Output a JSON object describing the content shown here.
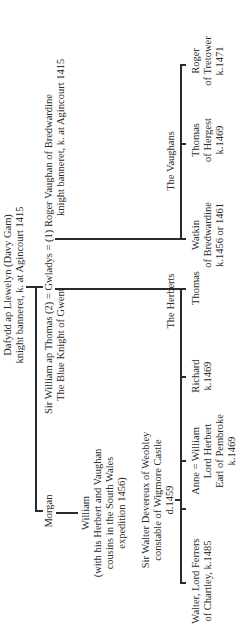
{
  "diagram": {
    "type": "family-tree",
    "orientation": "rotated-90-ccw",
    "root": {
      "line1": "Dafydd ap Llewelyn (Davy Gam)",
      "line2": "knight banneret, k. at Agincourt 1415"
    },
    "generation2": {
      "morgan": "Morgan",
      "william_ap_thomas": {
        "line1": "Sir William ap Thomas (2) = Gwladys = (1) Roger Vaughan of Bredwardine",
        "line2_left": "The Blue Knight of Gwent",
        "line2_right": "knight banneret, k. at Agincourt 1415"
      }
    },
    "william_son_of_morgan": {
      "line1": "William",
      "line2": "(with his Herbert and Vaughan",
      "line3": "cousins in the South Wales",
      "line4": "expedition 1456)"
    },
    "devereux": {
      "line1": "Sir Walter Devereux of Weobley",
      "line2": "constable of Wigmore Castle",
      "line3": "d.1459"
    },
    "group_labels": {
      "herberts": "The Herberts",
      "vaughans": "The Vaughans"
    },
    "devereux_children": {
      "walter": {
        "line1": "Walter, Lord Ferrers",
        "line2": "of Chartley, k.1485"
      },
      "anne": "Anne = William"
    },
    "herberts": {
      "william": {
        "line1": "Lord Herbert",
        "line2": "Earl of Pembroke",
        "line3": "k.1469"
      },
      "richard": {
        "line1": "Richard",
        "line2": "k.1469"
      },
      "thomas": {
        "line1": "Thomas"
      }
    },
    "vaughans": {
      "watkin": {
        "line1": "Watkin",
        "line2": "of Bredwardine",
        "line3": "k.1456 or 1461"
      },
      "thomas": {
        "line1": "Thomas",
        "line2": "of Hergest",
        "line3": "k.1469"
      },
      "roger": {
        "line1": "Roger",
        "line2": "of Tretower",
        "line3": "k.1471"
      }
    }
  }
}
